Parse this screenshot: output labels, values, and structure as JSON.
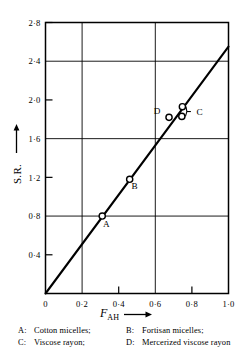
{
  "chart_data": {
    "type": "scatter",
    "title": "",
    "xlabel": "F_AH",
    "xlabel_display": "F",
    "xlabel_sub": "AH",
    "ylabel": "S.R.",
    "xlim": [
      0,
      1.0
    ],
    "ylim": [
      0,
      2.8
    ],
    "grid": true,
    "xticks": [
      0,
      0.2,
      0.4,
      0.6,
      0.8,
      1.0
    ],
    "xtick_labels": [
      "0",
      "0·2",
      "0·4",
      "0·6",
      "0·8",
      "1·0"
    ],
    "xgridlines": [
      0.2,
      0.6
    ],
    "yticks": [
      0.4,
      0.8,
      1.2,
      1.6,
      2.0,
      2.4,
      2.8
    ],
    "ytick_labels": [
      "0·4",
      "0·8",
      "1·2",
      "1·6",
      "2·0",
      "2·4",
      "2·8"
    ],
    "ygridlines": [
      0.8,
      1.6,
      2.4
    ],
    "points": [
      {
        "label": "A",
        "x": 0.31,
        "y": 0.8,
        "label_dx": 4,
        "label_dy": 11
      },
      {
        "label": "B",
        "x": 0.46,
        "y": 1.18,
        "label_dx": 5,
        "label_dy": 10
      },
      {
        "label": "D",
        "x": 0.675,
        "y": 1.82,
        "label_dx": -12,
        "label_dy": -3
      },
      {
        "label": "C",
        "x": 0.748,
        "y": 1.93,
        "label_dx": 0,
        "label_dy": 0
      },
      {
        "label": "C",
        "x": 0.745,
        "y": 1.83,
        "label_dx": 0,
        "label_dy": 0
      }
    ],
    "c_bracket_label": "C",
    "fit_line": {
      "x0": 0.0,
      "y0": 0.0,
      "x1": 1.0,
      "y1": 2.55
    }
  },
  "caption": {
    "rows": [
      [
        {
          "key": "A:",
          "text": "Cotton micelles;"
        },
        {
          "key": "B:",
          "text": "Fortisan micelles;"
        }
      ],
      [
        {
          "key": "C:",
          "text": "Viscose rayon;"
        },
        {
          "key": "D:",
          "text": "Mercerized viscose rayon"
        }
      ]
    ]
  },
  "colors": {
    "ink": "#000000",
    "background": "#ffffff",
    "grid": "#000000"
  }
}
